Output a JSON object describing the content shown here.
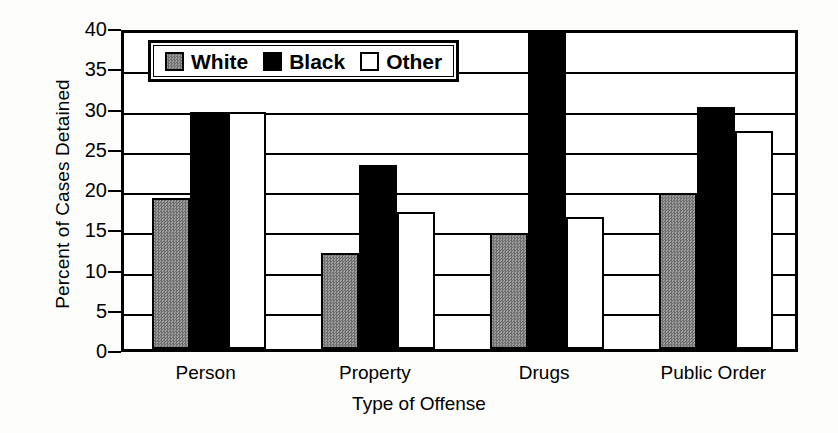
{
  "chart_data": {
    "type": "bar",
    "title": "",
    "xlabel": "Type of Offense",
    "ylabel": "Percent of Cases Detained",
    "categories": [
      "Person",
      "Property",
      "Drugs",
      "Public Order"
    ],
    "series": [
      {
        "name": "White",
        "color": "#808080",
        "values": [
          18.8,
          11.9,
          14.4,
          19.4
        ]
      },
      {
        "name": "Black",
        "color": "#000000",
        "values": [
          29.5,
          22.8,
          39.6,
          30.1
        ]
      },
      {
        "name": "Other",
        "color": "#ffffff",
        "values": [
          29.4,
          17.0,
          16.4,
          27.1
        ]
      }
    ],
    "ylim": [
      0,
      40
    ],
    "yticks": [
      0,
      5,
      10,
      15,
      20,
      25,
      30,
      35,
      40
    ],
    "ytick_labels": [
      "0",
      "5",
      "10",
      "15",
      "20",
      "25",
      "30",
      "35",
      "40"
    ],
    "grid": true,
    "legend_position": "upper-left-inside"
  },
  "legend": {
    "entries": [
      {
        "label": "White",
        "swatch": "gray-hatched-square"
      },
      {
        "label": "Black",
        "swatch": "black-square"
      },
      {
        "label": "Other",
        "swatch": "white-square"
      }
    ]
  }
}
